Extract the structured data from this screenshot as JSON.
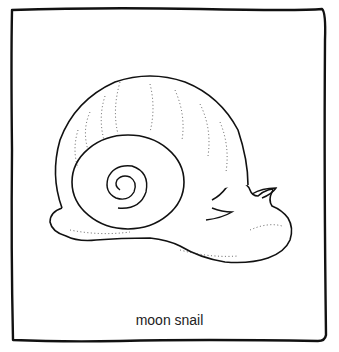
{
  "illustration": {
    "subject": "moon snail line drawing",
    "caption": "moon snail",
    "colors": {
      "line": "#111111",
      "background": "#ffffff"
    }
  }
}
